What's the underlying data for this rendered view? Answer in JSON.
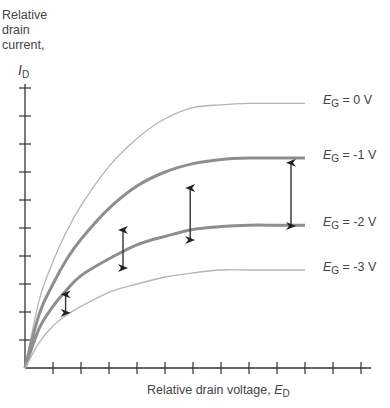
{
  "chart_data": {
    "type": "line",
    "title": "",
    "ylabel": "Relative drain current,",
    "ylabel_symbol": "I",
    "ylabel_symbol_sub": "D",
    "xlabel": "Relative drain voltage,",
    "xlabel_symbol": "E",
    "xlabel_symbol_sub": "D",
    "xlim": [
      0,
      12
    ],
    "ylim": [
      0,
      10
    ],
    "x_ticks": 12,
    "y_ticks": 10,
    "grid": false,
    "legend_position": "right, inline at curve ends",
    "x": [
      0,
      0.5,
      1,
      1.5,
      2,
      3,
      4,
      5,
      6,
      7,
      8,
      9,
      10
    ],
    "series": [
      {
        "name": "EG = 0 V",
        "label_var": "E",
        "label_sub": "G",
        "label_val": " = 0 V",
        "weight": "thin",
        "values": [
          0,
          2.4,
          3.8,
          4.9,
          5.8,
          7.2,
          8.2,
          8.9,
          9.3,
          9.4,
          9.45,
          9.45,
          9.45
        ]
      },
      {
        "name": "EG = -1 V",
        "label_var": "E",
        "label_sub": "G",
        "label_val": " = -1 V",
        "weight": "thick",
        "values": [
          0,
          1.9,
          3.0,
          3.9,
          4.6,
          5.7,
          6.5,
          7.0,
          7.3,
          7.45,
          7.5,
          7.5,
          7.5
        ]
      },
      {
        "name": "EG = -2 V",
        "label_var": "E",
        "label_sub": "G",
        "label_val": " = -2 V",
        "weight": "thick",
        "values": [
          0,
          1.4,
          2.2,
          2.8,
          3.3,
          3.9,
          4.4,
          4.7,
          4.95,
          5.05,
          5.1,
          5.1,
          5.1
        ]
      },
      {
        "name": "EG = -3 V",
        "label_var": "E",
        "label_sub": "G",
        "label_val": " = -3 V",
        "weight": "thin",
        "values": [
          0,
          0.9,
          1.5,
          1.9,
          2.2,
          2.7,
          3.0,
          3.25,
          3.4,
          3.5,
          3.5,
          3.5,
          3.5
        ]
      }
    ],
    "annotations": [
      {
        "type": "double-arrow",
        "x": 1.45,
        "from_series": "EG = -1 V",
        "to_series": "EG = -2 V",
        "y_top": 2.7,
        "y_bottom": 1.9
      },
      {
        "type": "double-arrow",
        "x": 3.5,
        "from_series": "EG = -1 V",
        "to_series": "EG = -2 V",
        "y_top": 5.0,
        "y_bottom": 3.5
      },
      {
        "type": "double-arrow",
        "x": 5.9,
        "from_series": "EG = -1 V",
        "to_series": "EG = -2 V",
        "y_top": 6.5,
        "y_bottom": 4.5
      },
      {
        "type": "double-arrow",
        "x": 9.5,
        "from_series": "EG = -1 V",
        "to_series": "EG = -2 V",
        "y_top": 7.4,
        "y_bottom": 5.0
      }
    ]
  },
  "labels": {
    "y_line1": "Relative",
    "y_line2": "drain",
    "y_line3": "current,"
  }
}
